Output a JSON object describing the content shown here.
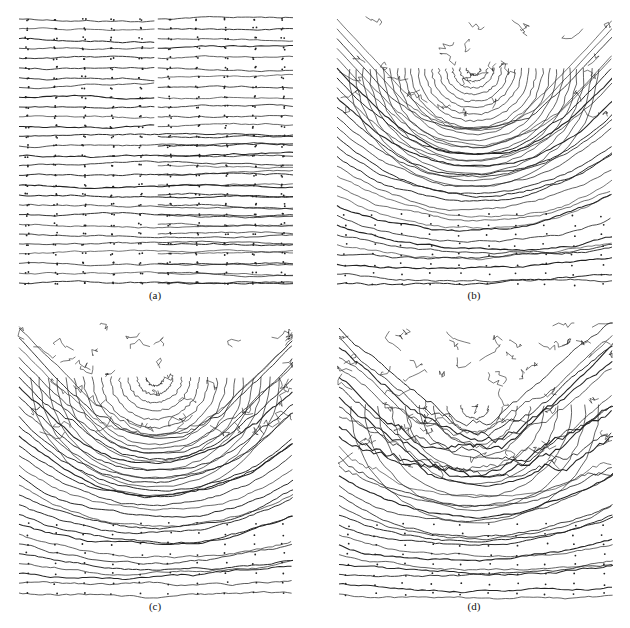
{
  "figure": {
    "panels": [
      {
        "id": "a",
        "label": "(a)",
        "pattern": "uniform-horizontal",
        "description": "Horizontal streamlines flowing left to right with a vertical gap in the upper half"
      },
      {
        "id": "b",
        "label": "(b)",
        "pattern": "u-vortex-strong",
        "description": "Streamlines forming a U-shaped bend centered upper-middle, horizontal flow at bottom"
      },
      {
        "id": "c",
        "label": "(c)",
        "pattern": "u-vortex-medium",
        "description": "Curved U-shaped flow with noisier, disordered streamlines in upper region"
      },
      {
        "id": "d",
        "label": "(d)",
        "pattern": "u-vortex-weak",
        "description": "Mostly disordered streamlines in upper half, horizontal flow in lower half"
      }
    ],
    "line_color": "#222222",
    "background": "#ffffff"
  }
}
